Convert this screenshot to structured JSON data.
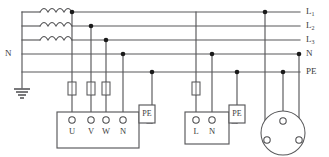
{
  "diagram": {
    "type": "electrical-schematic",
    "canvas": {
      "width": 329,
      "height": 157
    },
    "colors": {
      "wire": "#58585a",
      "node": "#1a1a1a",
      "background": "#ffffff",
      "text": "#3b3b3d"
    }
  },
  "bus_lines": [
    {
      "id": "L1",
      "label": "L",
      "subscript": "1",
      "y": 12,
      "has_coil": true
    },
    {
      "id": "L2",
      "label": "L",
      "subscript": "2",
      "y": 26,
      "has_coil": true
    },
    {
      "id": "L3",
      "label": "L",
      "subscript": "3",
      "y": 40,
      "has_coil": true
    },
    {
      "id": "N",
      "label": "N",
      "subscript": "",
      "y": 54,
      "has_coil": false
    },
    {
      "id": "PE",
      "label": "PE",
      "subscript": "",
      "y": 72,
      "has_coil": false
    }
  ],
  "left_labels": [
    {
      "text": "N",
      "x": 6,
      "y": 54
    }
  ],
  "source": {
    "name": "transformer-star-point",
    "coil_count": 3,
    "star_bus_x": 22,
    "earth_symbol": {
      "name": "earth-ground",
      "x": 22,
      "top_y": 72,
      "bars": [
        14,
        9,
        5
      ]
    }
  },
  "taps": [
    {
      "id": "tap-L1-left",
      "x": 72,
      "from": "L1",
      "dot": true
    },
    {
      "id": "tap-L2-left",
      "x": 91,
      "from": "L2",
      "dot": true
    },
    {
      "id": "tap-L3-left",
      "x": 106,
      "from": "L3",
      "dot": true
    },
    {
      "id": "tap-N-left",
      "x": 123,
      "from": "N",
      "dot": true
    },
    {
      "id": "tap-PE-left",
      "x": 152,
      "from": "PE",
      "dot": true
    },
    {
      "id": "tap-L1-right",
      "x": 196,
      "from": "L1",
      "dot": false
    },
    {
      "id": "tap-N-right",
      "x": 208,
      "from": "N",
      "dot": true
    },
    {
      "id": "tap-PE-right",
      "x": 230,
      "from": "PE",
      "dot": true
    },
    {
      "id": "tap-L1-plug",
      "x": 265,
      "from": "L1",
      "dot": true
    },
    {
      "id": "tap-N-plug",
      "x": 248,
      "from": "N",
      "dot": true
    },
    {
      "id": "tap-PE-plug",
      "x": 283,
      "from": "PE",
      "dot": true
    }
  ],
  "fuses": [
    {
      "id": "fuse-U",
      "x": 72,
      "y": 88,
      "label": ""
    },
    {
      "id": "fuse-V",
      "x": 91,
      "y": 88,
      "label": ""
    },
    {
      "id": "fuse-W",
      "x": 106,
      "y": 88,
      "label": ""
    },
    {
      "id": "fuse-L",
      "x": 196,
      "y": 88,
      "label": ""
    }
  ],
  "outlets": [
    {
      "id": "outlet-three-phase",
      "name": "three-phase-socket",
      "box": {
        "x": 57,
        "y": 112,
        "width": 82,
        "height": 36
      },
      "terminals": [
        {
          "label": "U",
          "x": 72
        },
        {
          "label": "V",
          "x": 91
        },
        {
          "label": "W",
          "x": 106
        },
        {
          "label": "N",
          "x": 123
        }
      ],
      "pe_tab": {
        "label": "PE",
        "x": 139,
        "y": 105,
        "width": 16,
        "height": 18
      }
    },
    {
      "id": "outlet-single-phase",
      "name": "single-phase-socket",
      "box": {
        "x": 185,
        "y": 112,
        "width": 44,
        "height": 32
      },
      "terminals": [
        {
          "label": "L",
          "x": 196
        },
        {
          "label": "N",
          "x": 212
        }
      ],
      "pe_tab": {
        "label": "PE",
        "x": 229,
        "y": 105,
        "width": 16,
        "height": 18
      }
    }
  ],
  "round_socket": {
    "id": "round-socket",
    "name": "round-plug-socket",
    "center_x": 283,
    "center_y": 133,
    "radius": 22,
    "pins": [
      {
        "id": "pin-pe",
        "x": 283,
        "y": 121,
        "r": 3
      },
      {
        "id": "pin-l",
        "x": 267,
        "y": 140,
        "r": 3
      },
      {
        "id": "pin-n",
        "x": 299,
        "y": 140,
        "r": 3
      }
    ]
  }
}
